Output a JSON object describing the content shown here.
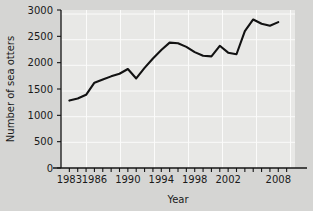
{
  "chart_data": {
    "type": "line",
    "title": "",
    "xlabel": "Year",
    "ylabel": "Number of sea otters",
    "xlim": [
      1982,
      2010
    ],
    "ylim": [
      0,
      3000
    ],
    "grid": true,
    "legend": "none",
    "x_tick_labels": [
      "1983",
      "1986",
      "1990",
      "1994",
      "1998",
      "2002",
      "2008"
    ],
    "x_tick_values": [
      1983,
      1986,
      1990,
      1994,
      1998,
      2002,
      2008
    ],
    "x_minor_ticks_every": 1,
    "y_tick_labels": [
      "0",
      "500",
      "1000",
      "1500",
      "2000",
      "2500",
      "3000"
    ],
    "y_tick_values": [
      0,
      500,
      1000,
      1500,
      2000,
      2500,
      3000
    ],
    "series": [
      {
        "name": "Number of sea otters",
        "color": "#121212",
        "x": [
          1983,
          1984,
          1985,
          1986,
          1987,
          1988,
          1989,
          1990,
          1991,
          1992,
          1993,
          1994,
          1995,
          1996,
          1997,
          1998,
          1999,
          2000,
          2001,
          2002,
          2003,
          2004,
          2005,
          2006,
          2007,
          2008
        ],
        "values": [
          1280,
          1320,
          1390,
          1620,
          1680,
          1740,
          1790,
          1880,
          1700,
          1900,
          2080,
          2240,
          2380,
          2370,
          2300,
          2200,
          2130,
          2120,
          2320,
          2190,
          2160,
          2600,
          2820,
          2740,
          2700,
          2770
        ]
      }
    ]
  },
  "colors": {
    "figure_background": "#d5d5d3",
    "plot_background": "#e8e8e6",
    "gridline": "#fbfbfa",
    "axis": "#141414",
    "text": "#1a1a1a",
    "line": "#121212"
  }
}
